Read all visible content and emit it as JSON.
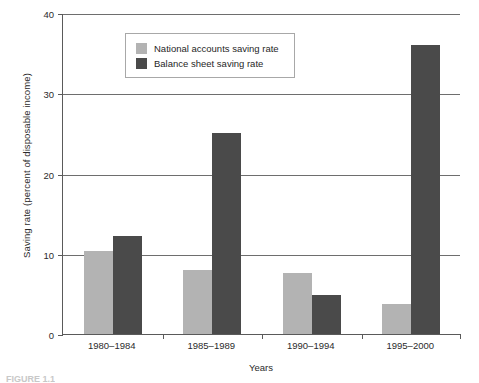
{
  "chart_data": {
    "type": "bar",
    "title": "",
    "xlabel": "Years",
    "ylabel": "Saving rate (percent of disposable income)",
    "categories": [
      "1980–1984",
      "1985–1989",
      "1990–1994",
      "1995–2000"
    ],
    "series": [
      {
        "name": "National accounts saving rate",
        "color": "#b3b3b3",
        "values": [
          10.3,
          8.0,
          7.6,
          3.7
        ]
      },
      {
        "name": "Balance sheet saving rate",
        "color": "#4a4a4a",
        "values": [
          12.2,
          25.1,
          4.8,
          36.0
        ]
      }
    ],
    "ylim": [
      0,
      40
    ],
    "yticks": [
      0,
      10,
      20,
      30,
      40
    ],
    "ytick_labels": [
      "0",
      "10",
      "20",
      "30",
      "40"
    ],
    "grid": "horizontal",
    "gridlines_at": [
      10,
      20,
      30,
      40
    ],
    "legend_position": "top-left-inside"
  },
  "axes": {
    "y_title": "Saving rate (percent of disposable income)",
    "x_title": "Years"
  },
  "legend": {
    "items": [
      {
        "label": "National accounts saving rate",
        "swatch": "light"
      },
      {
        "label": "Balance sheet saving rate",
        "swatch": "dark"
      }
    ]
  },
  "caption": {
    "text": "FIGURE 1.1"
  }
}
